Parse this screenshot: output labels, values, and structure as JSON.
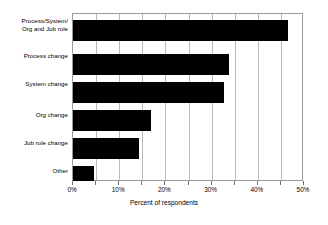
{
  "chart_data": {
    "type": "bar",
    "orientation": "horizontal",
    "title": "",
    "xlabel": "Percent of respondents",
    "ylabel": "",
    "xlim": [
      0,
      50
    ],
    "grid": true,
    "grid_interval": 5,
    "legend": "none",
    "bar_color": "#000000",
    "categories": [
      "Process/System/\nOrg and Job role",
      "Process change",
      "System change",
      "Org change",
      "Job role change",
      "Other"
    ],
    "values": [
      47,
      34,
      33,
      17,
      14.5,
      4.5
    ],
    "tick_labels": [
      "0%",
      "10%",
      "20%",
      "30%",
      "40%",
      "50%"
    ],
    "tick_values": [
      0,
      10,
      20,
      30,
      40,
      50
    ]
  },
  "axis": {
    "x_title": "Percent of respondents"
  }
}
